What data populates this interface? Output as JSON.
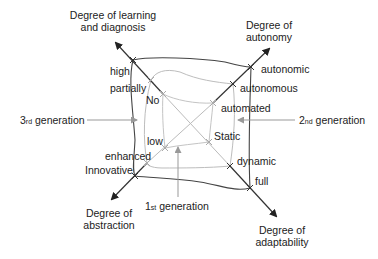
{
  "axes": {
    "learning": {
      "title_line1": "Degree of learning",
      "title_line2": "and diagnosis",
      "levels": [
        "No",
        "partially",
        "high"
      ]
    },
    "autonomy": {
      "title_line1": "Degree of",
      "title_line2": "autonomy",
      "levels": [
        "automated",
        "autonomous",
        "autonomic"
      ]
    },
    "abstraction": {
      "title_line1": "Degree of",
      "title_line2": "abstraction",
      "levels": [
        "low",
        "enhanced",
        "Innovative"
      ]
    },
    "adaptability": {
      "title_line1": "Degree of",
      "title_line2": "adaptability",
      "levels": [
        "Static",
        "dynamic",
        "full"
      ]
    }
  },
  "generations": {
    "first": {
      "num": "1",
      "suffix": "st",
      "word": "generation"
    },
    "second": {
      "num": "2",
      "suffix": "nd",
      "word": "generation"
    },
    "third": {
      "num": "3",
      "suffix": "rd",
      "word": "generation"
    }
  },
  "colors": {
    "outer_line": "#444444",
    "inner_line": "#bbbbbb",
    "axis_line": "#333333",
    "text": "#222222"
  }
}
